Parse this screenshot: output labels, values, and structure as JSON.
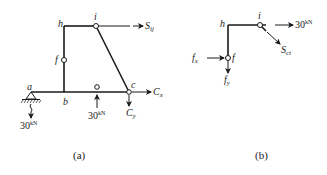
{
  "figure_a": {
    "caption": "(a)",
    "nodes": {
      "a": "a",
      "b": "b",
      "c": "c",
      "f": "f",
      "h": "h",
      "i": "i"
    },
    "forces": {
      "s_ij": {
        "main": "S",
        "sub": "ij"
      },
      "c_x": {
        "main": "C",
        "sub": "x"
      },
      "c_y": {
        "main": "C",
        "sub": "y"
      },
      "load_mid": {
        "value": "30",
        "unit": "kN"
      },
      "load_support": {
        "value": "30",
        "unit": "kN"
      }
    }
  },
  "figure_b": {
    "caption": "(b)",
    "nodes": {
      "h": "h",
      "i": "i",
      "f": "f"
    },
    "forces": {
      "load_i": {
        "value": "30",
        "unit": "kN"
      },
      "s_ci": {
        "main": "S",
        "sub": "ci"
      },
      "f_x": {
        "main": "f",
        "sub": "x"
      },
      "f_y": {
        "main": "f",
        "sub": "y"
      }
    }
  },
  "colors": {
    "stroke": "#1a1a1a",
    "background": "#ffffff"
  }
}
